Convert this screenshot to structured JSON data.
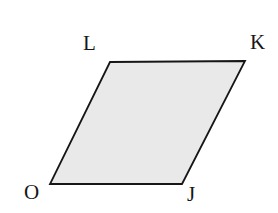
{
  "figure": {
    "kind": "parallelogram",
    "name": "parallelogram-OJKL",
    "canvas": {
      "width": 278,
      "height": 213,
      "background": "#ffffff"
    },
    "shape": {
      "fill": "#e9e9e9",
      "stroke": "#161616",
      "stroke_width": 1.8,
      "points": "110,62 245,61 182,184 50,184"
    },
    "vertices": [
      {
        "id": "L",
        "label": "L",
        "x": 110,
        "y": 62,
        "label_x": 83,
        "label_y": 33
      },
      {
        "id": "K",
        "label": "K",
        "x": 245,
        "y": 61,
        "label_x": 250,
        "label_y": 32
      },
      {
        "id": "J",
        "label": "J",
        "x": 182,
        "y": 184,
        "label_x": 187,
        "label_y": 184
      },
      {
        "id": "O",
        "label": "O",
        "x": 50,
        "y": 184,
        "label_x": 24,
        "label_y": 182
      }
    ],
    "edges": [
      {
        "id": "LK",
        "from": "L",
        "to": "K"
      },
      {
        "id": "KJ",
        "from": "K",
        "to": "J"
      },
      {
        "id": "JO",
        "from": "J",
        "to": "O"
      },
      {
        "id": "OL",
        "from": "O",
        "to": "L"
      }
    ]
  }
}
